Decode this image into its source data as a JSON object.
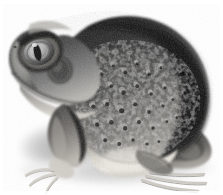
{
  "image": {
    "kind": "photograph",
    "subject": "frog",
    "common_name": "spadefoot toad",
    "view": "side profile facing left",
    "color_mode": "grayscale",
    "background_label": "white background",
    "width_px": 223,
    "height_px": 195,
    "caption": "Grayscale side-profile photograph of a warty spadefoot toad sitting on a white background, facing left, with a soft cast shadow beneath it.",
    "palette": {
      "background": "#ffffff",
      "shadow": "#cfcfcf",
      "shadow_soft": "#e3e3e3",
      "body_dark": "#1a1a1a",
      "body_darkest": "#090909",
      "body_mid": "#5a5a5a",
      "body_light": "#9a9a9a",
      "belly_light": "#e8e6e0",
      "belly_mid": "#c9c6bd",
      "eye_iris": "#bdbdbd",
      "eye_iris_dark": "#6f6f6f",
      "eye_pupil": "#0a0a0a",
      "eye_highlight": "#f2f2f2",
      "wart_light": "#b4b4b4",
      "wart_dark": "#101010",
      "toe_light": "#efefef",
      "toe_line": "#b0b0b0"
    },
    "parts": [
      {
        "id": "head",
        "label": "head"
      },
      {
        "id": "snout",
        "label": "snout"
      },
      {
        "id": "eye",
        "label": "eye"
      },
      {
        "id": "pupil",
        "label": "vertical pupil"
      },
      {
        "id": "iris",
        "label": "iris"
      },
      {
        "id": "tympanum",
        "label": "tympanum"
      },
      {
        "id": "jaw",
        "label": "jaw line"
      },
      {
        "id": "throat",
        "label": "throat"
      },
      {
        "id": "back",
        "label": "back"
      },
      {
        "id": "rump",
        "label": "rump"
      },
      {
        "id": "flank",
        "label": "flank"
      },
      {
        "id": "warts",
        "label": "warty tubercles"
      },
      {
        "id": "belly",
        "label": "pale belly"
      },
      {
        "id": "foreleg",
        "label": "front leg"
      },
      {
        "id": "forefoot",
        "label": "front foot"
      },
      {
        "id": "hindleg",
        "label": "hind leg"
      },
      {
        "id": "hindfoot",
        "label": "hind foot"
      },
      {
        "id": "toes",
        "label": "toes"
      },
      {
        "id": "shadow",
        "label": "cast shadow"
      }
    ]
  }
}
